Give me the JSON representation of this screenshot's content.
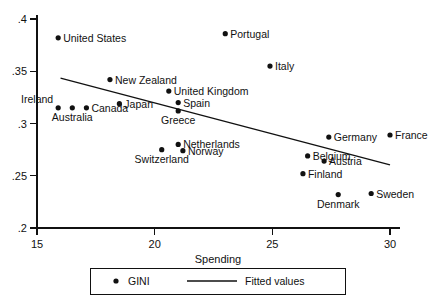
{
  "chart_data": {
    "type": "scatter",
    "title": "",
    "xlabel": "Spending",
    "ylabel": "",
    "xlim": [
      15,
      30
    ],
    "ylim": [
      0.2,
      0.4
    ],
    "grid": false,
    "legend_position": "bottom",
    "x_ticks": [
      "15",
      "20",
      "25",
      "30"
    ],
    "x_tick_values": [
      15,
      20,
      25,
      30
    ],
    "y_ticks": [
      ".4",
      ".35",
      ".3",
      ".25",
      ".2"
    ],
    "y_tick_values": [
      0.4,
      0.35,
      0.3,
      0.25,
      0.2
    ],
    "series": [
      {
        "name": "GINI",
        "marker": "filled-circle",
        "color": "#111111",
        "points": [
          {
            "label": "United States",
            "x": 15.9,
            "y": 0.382,
            "label_side": "right"
          },
          {
            "label": "Ireland",
            "x": 15.9,
            "y": 0.315,
            "label_side": "left"
          },
          {
            "label": "Australia",
            "x": 16.5,
            "y": 0.315,
            "label_side": "below"
          },
          {
            "label": "Canada",
            "x": 17.1,
            "y": 0.315,
            "label_side": "right"
          },
          {
            "label": "New Zealand",
            "x": 18.1,
            "y": 0.342,
            "label_side": "right"
          },
          {
            "label": "Japan",
            "x": 18.5,
            "y": 0.319,
            "label_side": "right"
          },
          {
            "label": "United Kingdom",
            "x": 20.6,
            "y": 0.331,
            "label_side": "right"
          },
          {
            "label": "Spain",
            "x": 21.0,
            "y": 0.32,
            "label_side": "right"
          },
          {
            "label": "Greece",
            "x": 21.0,
            "y": 0.312,
            "label_side": "below"
          },
          {
            "label": "Netherlands",
            "x": 21.0,
            "y": 0.28,
            "label_side": "right"
          },
          {
            "label": "Switzerland",
            "x": 20.3,
            "y": 0.275,
            "label_side": "below"
          },
          {
            "label": "Norway",
            "x": 21.2,
            "y": 0.274,
            "label_side": "right"
          },
          {
            "label": "Portugal",
            "x": 23.0,
            "y": 0.386,
            "label_side": "right"
          },
          {
            "label": "Italy",
            "x": 24.9,
            "y": 0.355,
            "label_side": "right"
          },
          {
            "label": "Finland",
            "x": 26.3,
            "y": 0.252,
            "label_side": "right"
          },
          {
            "label": "Belgium",
            "x": 26.5,
            "y": 0.269,
            "label_side": "right"
          },
          {
            "label": "Austria",
            "x": 27.2,
            "y": 0.264,
            "label_side": "right"
          },
          {
            "label": "Germany",
            "x": 27.4,
            "y": 0.287,
            "label_side": "right"
          },
          {
            "label": "Denmark",
            "x": 27.8,
            "y": 0.232,
            "label_side": "below"
          },
          {
            "label": "Sweden",
            "x": 29.2,
            "y": 0.233,
            "label_side": "right"
          },
          {
            "label": "France",
            "x": 30.0,
            "y": 0.289,
            "label_side": "right"
          }
        ]
      }
    ],
    "fitted_line": {
      "name": "Fitted values",
      "x_start": 16.0,
      "y_start": 0.3435,
      "x_end": 30.0,
      "y_end": 0.2605
    },
    "legend_entries": [
      {
        "label": "GINI",
        "symbol": "filled-circle"
      },
      {
        "label": "Fitted values",
        "symbol": "line"
      }
    ]
  }
}
